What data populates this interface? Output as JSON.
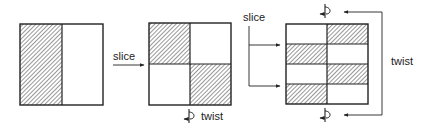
{
  "diagram": {
    "slice_label_1": "slice",
    "slice_label_2": "slice",
    "twist_label_1": "twist",
    "twist_label_2": "twist",
    "stages": [
      {
        "name": "original",
        "grid": [
          [
            1,
            0
          ]
        ]
      },
      {
        "name": "after-slice",
        "grid": [
          [
            1,
            0
          ],
          [
            0,
            1
          ]
        ]
      },
      {
        "name": "after-slice-twist",
        "grid": [
          [
            0,
            1
          ],
          [
            1,
            0
          ],
          [
            0,
            1
          ],
          [
            1,
            0
          ]
        ]
      }
    ],
    "colors": {
      "ink": "#222222",
      "hatch": "#444444"
    }
  }
}
